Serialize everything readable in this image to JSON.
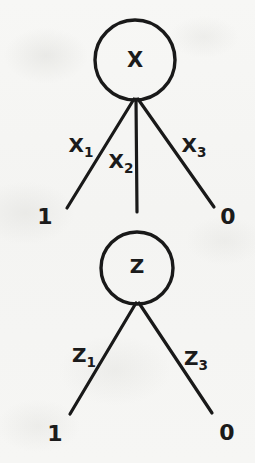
{
  "diagram": {
    "background_color": "#f6f6f4",
    "ink_color": "#191919",
    "nodes": [
      {
        "id": "node-x",
        "label": "X",
        "cx": 135,
        "cy": 60,
        "r": 40,
        "stroke_width": 3.4
      },
      {
        "id": "node-z",
        "label": "Z",
        "cx": 137,
        "cy": 268,
        "r": 36,
        "stroke_width": 3.4
      }
    ],
    "edges": [
      {
        "id": "edge-x1",
        "label": "X",
        "subscript": "1",
        "from": "node-x",
        "x1": 134,
        "y1": 99,
        "x2": 67,
        "y2": 208,
        "label_x": 81,
        "label_y": 152,
        "stroke_width": 3.2
      },
      {
        "id": "edge-x2",
        "label": "X",
        "subscript": "2",
        "from": "node-x",
        "x1": 136,
        "y1": 99,
        "x2": 137,
        "y2": 212,
        "label_x": 121,
        "label_y": 168,
        "stroke_width": 3.2
      },
      {
        "id": "edge-x3",
        "label": "X",
        "subscript": "3",
        "from": "node-x",
        "x1": 138,
        "y1": 99,
        "x2": 214,
        "y2": 207,
        "label_x": 194,
        "label_y": 152,
        "stroke_width": 3.2
      },
      {
        "id": "edge-z1",
        "label": "Z",
        "subscript": "1",
        "from": "node-z",
        "x1": 136,
        "y1": 303,
        "x2": 70,
        "y2": 414,
        "label_x": 84,
        "label_y": 362,
        "stroke_width": 3.2
      },
      {
        "id": "edge-z3",
        "label": "Z",
        "subscript": "3",
        "from": "node-z",
        "x1": 139,
        "y1": 303,
        "x2": 212,
        "y2": 413,
        "label_x": 196,
        "label_y": 365,
        "stroke_width": 3.2
      }
    ],
    "terminals": [
      {
        "id": "terminal-x-left",
        "label": "1",
        "x": 45,
        "y": 224
      },
      {
        "id": "terminal-x-right",
        "label": "0",
        "x": 228,
        "y": 224
      },
      {
        "id": "terminal-z-left",
        "label": "1",
        "x": 55,
        "y": 441
      },
      {
        "id": "terminal-z-right",
        "label": "0",
        "x": 227,
        "y": 440
      }
    ]
  }
}
